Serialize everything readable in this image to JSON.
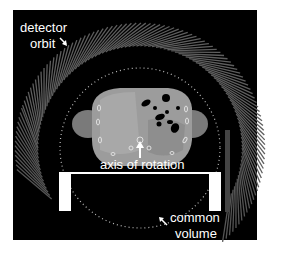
{
  "figure": {
    "labels": {
      "detector_line1": "detector",
      "detector_line2": "orbit",
      "axis": "axis of rotation",
      "common_line1": "common",
      "common_line2": "volume"
    },
    "colors": {
      "background": "#ffffff",
      "panel": "#000000",
      "detector": "#5a5a5a",
      "detector_dark": "#3a3a3a",
      "body_soft_tissue": "#9c9c9c",
      "body_organ": "#b4b4b4",
      "air_pockets": "#000000",
      "table": "#ffffff",
      "label_text": "#ffffff"
    },
    "geometry": {
      "panel": {
        "x": 13,
        "y": 10,
        "w": 244,
        "h": 230
      },
      "rotation_center": {
        "x": 140,
        "y": 148
      },
      "common_volume_radius": 80,
      "detector_inner_radius": 102,
      "detector_outer_radius": 125
    }
  }
}
